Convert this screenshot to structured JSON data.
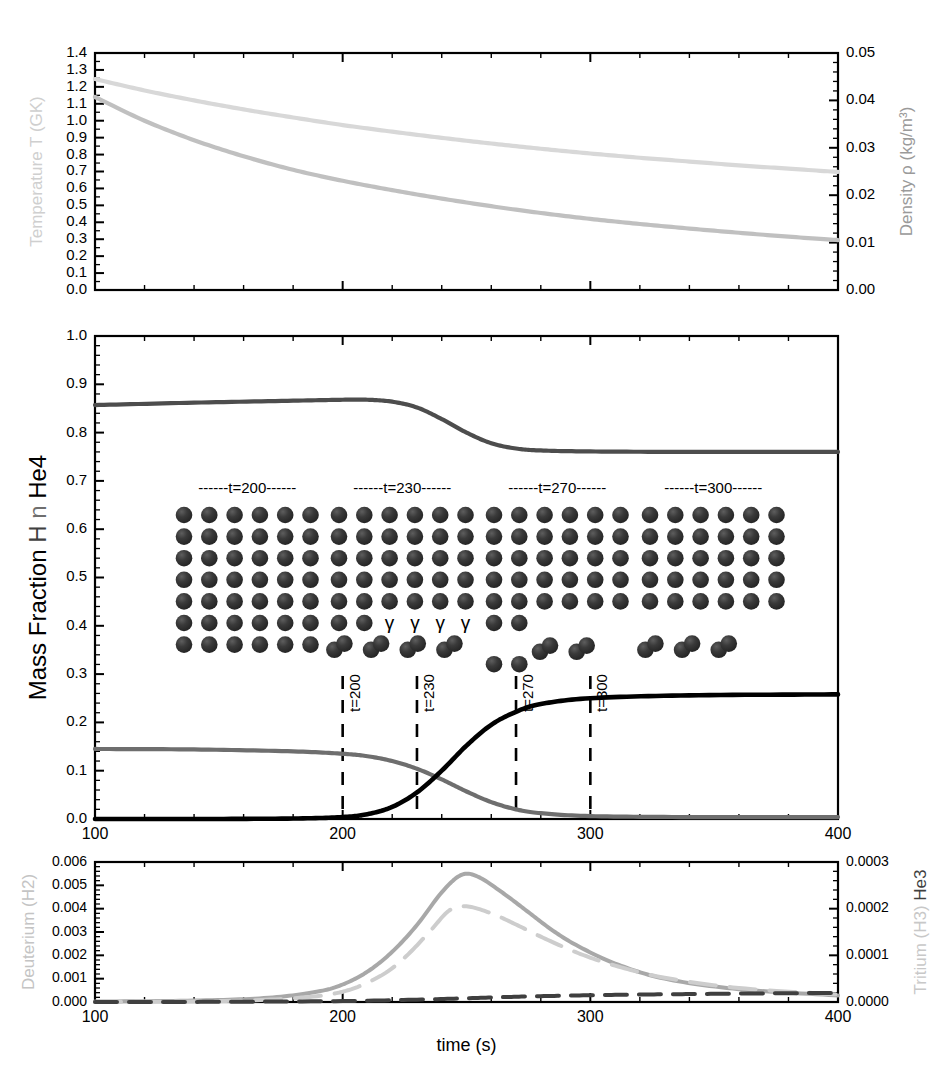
{
  "figure": {
    "xlabel": "time (s)",
    "x_ticks": [
      "100",
      "200",
      "300",
      "400"
    ],
    "xlim": [
      100,
      400
    ]
  },
  "colors": {
    "black": "#000000",
    "dark_gray": "#3f3f3f",
    "mid_gray": "#6e6e6e",
    "light_gray": "#c8c8c8",
    "very_light_gray": "#d8d8d8",
    "sphere": "#2f2f2f",
    "sphere_highlight": "#585858"
  },
  "panel_top": {
    "left_axis_label": "Temperature T (GK)",
    "right_axis_label": "Density ρ (kg/m³)",
    "left_ticks": [
      "0.0",
      "0.1",
      "0.2",
      "0.3",
      "0.4",
      "0.5",
      "0.6",
      "0.7",
      "0.8",
      "0.9",
      "1.0",
      "1.1",
      "1.2",
      "1.3",
      "1.4"
    ],
    "right_ticks": [
      "0.00",
      "0.01",
      "0.02",
      "0.03",
      "0.04",
      "0.05"
    ],
    "ylim_left": [
      0.0,
      1.4
    ],
    "ylim_right": [
      0.0,
      0.05
    ]
  },
  "panel_mid": {
    "left_axis_label_parts": [
      {
        "text": "Mass Fraction ",
        "color": "#000000"
      },
      {
        "text": "H",
        "color": "#3f3f3f"
      },
      {
        "text": " n ",
        "color": "#6e6e6e"
      },
      {
        "text": "He4",
        "color": "#000000"
      }
    ],
    "left_axis_label": "Mass Fraction H n He4",
    "ticks": [
      "0.0",
      "0.1",
      "0.2",
      "0.3",
      "0.4",
      "0.5",
      "0.6",
      "0.7",
      "0.8",
      "0.9",
      "1.0"
    ],
    "ylim": [
      0.0,
      1.0
    ],
    "vlines": [
      {
        "t": 200,
        "label": "t=200"
      },
      {
        "t": 230,
        "label": "t=230"
      },
      {
        "t": 270,
        "label": "t=270"
      },
      {
        "t": 300,
        "label": "t=300"
      }
    ],
    "inset_blocks": [
      {
        "header": "------t=200------",
        "cols": 6,
        "full_rows": 7,
        "partial_row_spheres": 0,
        "gammas": 0,
        "pairs": 0,
        "pair_row": 0,
        "extra_row_spheres": 0
      },
      {
        "header": "------t=230------",
        "cols": 6,
        "full_rows": 5,
        "partial_row_spheres": 2,
        "gammas": 4,
        "pairs": 4,
        "pair_row": 6,
        "extra_row_spheres": 0
      },
      {
        "header": "------t=270------",
        "cols": 6,
        "full_rows": 5,
        "partial_row_spheres": 2,
        "gammas": 0,
        "pairs": 2,
        "pair_row": 6,
        "extra_row_spheres": 2
      },
      {
        "header": "------t=300------",
        "cols": 6,
        "full_rows": 5,
        "partial_row_spheres": 0,
        "gammas": 0,
        "pairs": 3,
        "pair_row": 6,
        "extra_row_spheres": 0
      }
    ],
    "gamma_symbol": "γ"
  },
  "panel_bot": {
    "left_axis_label": "Deuterium (H2)",
    "right_axis_label_parts": [
      {
        "text": "Tritium (H3)",
        "color": "#c8c8c8"
      },
      {
        "text": " He3",
        "color": "#3f3f3f"
      }
    ],
    "right_axis_label": "Tritium (H3) He3",
    "left_ticks": [
      "0.000",
      "0.001",
      "0.002",
      "0.003",
      "0.004",
      "0.005",
      "0.006"
    ],
    "right_ticks": [
      "0.0000",
      "0.0001",
      "0.0002",
      "0.0003"
    ],
    "ylim_left": [
      0.0,
      0.006
    ],
    "ylim_right": [
      0.0,
      0.0003
    ]
  },
  "chart_data": [
    {
      "type": "line",
      "title": "",
      "panel": "top",
      "xlabel": "time (s)",
      "ylabel": "Temperature T (GK)",
      "y2label": "Density ρ (kg/m³)",
      "xlim": [
        100,
        400
      ],
      "ylim": [
        0.0,
        1.4
      ],
      "ylim2": [
        0.0,
        0.05
      ],
      "grid": false,
      "legend": "none",
      "series": [
        {
          "name": "Density ρ (kg/m³)",
          "axis": "right",
          "color": "#d8d8d8",
          "style": "solid",
          "x": [
            100,
            120,
            140,
            160,
            180,
            200,
            220,
            240,
            260,
            280,
            300,
            320,
            340,
            360,
            380,
            400
          ],
          "y": [
            0.0445,
            0.0421,
            0.04,
            0.0381,
            0.0364,
            0.0348,
            0.0334,
            0.0321,
            0.0309,
            0.0298,
            0.0288,
            0.0279,
            0.0271,
            0.0263,
            0.0256,
            0.0249
          ]
        },
        {
          "name": "Temperature T (GK)",
          "axis": "left",
          "color": "#c0c0c0",
          "style": "solid",
          "x": [
            100,
            120,
            140,
            160,
            180,
            200,
            220,
            240,
            260,
            280,
            300,
            320,
            340,
            360,
            380,
            400
          ],
          "y": [
            1.14,
            1.0,
            0.885,
            0.79,
            0.71,
            0.645,
            0.59,
            0.54,
            0.495,
            0.455,
            0.42,
            0.39,
            0.363,
            0.338,
            0.315,
            0.295
          ]
        }
      ]
    },
    {
      "type": "line",
      "title": "",
      "panel": "middle",
      "xlabel": "time (s)",
      "ylabel": "Mass Fraction H n He4",
      "xlim": [
        100,
        400
      ],
      "ylim": [
        0.0,
        1.0
      ],
      "grid": false,
      "legend": "none",
      "series": [
        {
          "name": "H",
          "axis": "left",
          "color": "#4d4d4d",
          "style": "solid",
          "x": [
            100,
            140,
            180,
            200,
            210,
            220,
            230,
            240,
            250,
            260,
            270,
            280,
            300,
            340,
            400
          ],
          "y": [
            0.857,
            0.862,
            0.866,
            0.868,
            0.868,
            0.864,
            0.852,
            0.828,
            0.8,
            0.778,
            0.767,
            0.763,
            0.761,
            0.76,
            0.76
          ]
        },
        {
          "name": "n",
          "axis": "left",
          "color": "#6e6e6e",
          "style": "solid",
          "x": [
            100,
            140,
            180,
            200,
            210,
            220,
            230,
            240,
            250,
            260,
            270,
            280,
            300,
            340,
            400
          ],
          "y": [
            0.145,
            0.144,
            0.14,
            0.135,
            0.13,
            0.12,
            0.104,
            0.082,
            0.057,
            0.035,
            0.02,
            0.012,
            0.006,
            0.004,
            0.004
          ]
        },
        {
          "name": "He4",
          "axis": "left",
          "color": "#000000",
          "style": "solid",
          "x": [
            100,
            140,
            180,
            200,
            210,
            220,
            230,
            240,
            250,
            260,
            270,
            280,
            300,
            340,
            400
          ],
          "y": [
            0.0,
            0.0,
            0.001,
            0.004,
            0.01,
            0.025,
            0.055,
            0.1,
            0.152,
            0.195,
            0.222,
            0.238,
            0.25,
            0.256,
            0.258
          ]
        }
      ]
    },
    {
      "type": "line",
      "title": "",
      "panel": "bottom",
      "xlabel": "time (s)",
      "ylabel": "Deuterium (H2)",
      "y2label": "Tritium (H3) He3",
      "xlim": [
        100,
        400
      ],
      "ylim": [
        0.0,
        0.006
      ],
      "ylim2": [
        0.0,
        0.0003
      ],
      "grid": false,
      "legend": "none",
      "series": [
        {
          "name": "Deuterium (H2)",
          "axis": "left",
          "color": "#a8a8a8",
          "style": "solid",
          "x": [
            100,
            140,
            170,
            190,
            200,
            210,
            220,
            230,
            240,
            248,
            255,
            265,
            275,
            285,
            295,
            310,
            330,
            360,
            400
          ],
          "y": [
            2e-05,
            6e-05,
            0.00018,
            0.00045,
            0.00075,
            0.0013,
            0.00215,
            0.0033,
            0.0047,
            0.00545,
            0.00535,
            0.00465,
            0.00385,
            0.00305,
            0.0024,
            0.00165,
            0.001,
            0.00055,
            0.00028
          ]
        },
        {
          "name": "Tritium (H3)",
          "axis": "right",
          "color": "#cdcdcd",
          "style": "dashed",
          "x": [
            100,
            150,
            180,
            200,
            215,
            225,
            235,
            243,
            250,
            260,
            270,
            280,
            295,
            310,
            330,
            360,
            400
          ],
          "y": [
            0.0,
            2e-06,
            8e-06,
            2.2e-05,
            5.5e-05,
            9.5e-05,
            0.00015,
            0.000196,
            0.000205,
            0.00019,
            0.000166,
            0.00014,
            0.000105,
            7.8e-05,
            5.2e-05,
            3e-05,
            1.6e-05
          ]
        },
        {
          "name": "He3",
          "axis": "right",
          "color": "#3f3f3f",
          "style": "dashed",
          "x": [
            100,
            150,
            200,
            230,
            250,
            265,
            280,
            300,
            320,
            340,
            360,
            380,
            400
          ],
          "y": [
            0.0,
            4e-07,
            2e-06,
            5e-06,
            8e-06,
            1.05e-05,
            1.25e-05,
            1.45e-05,
            1.6e-05,
            1.7e-05,
            1.8e-05,
            1.88e-05,
            1.95e-05
          ]
        }
      ]
    }
  ]
}
